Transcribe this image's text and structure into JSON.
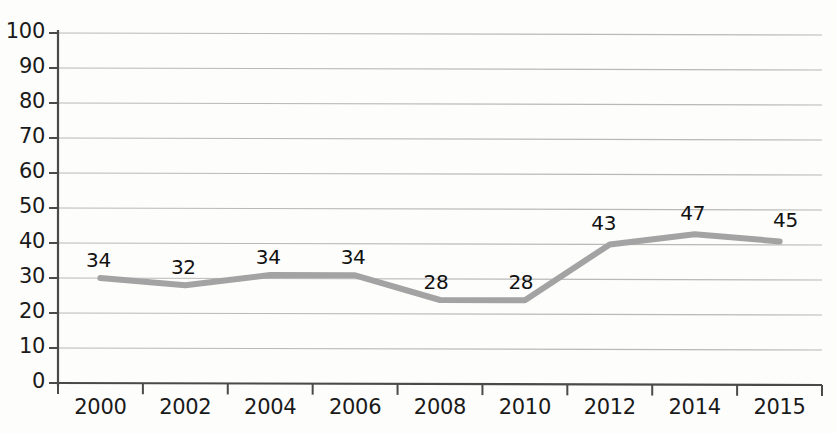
{
  "chart_data": {
    "type": "line",
    "title": "",
    "subtitle": "",
    "xlabel": "",
    "ylabel": "",
    "categories": [
      "2000",
      "2002",
      "2004",
      "2006",
      "2008",
      "2010",
      "2012",
      "2014",
      "2015"
    ],
    "values": [
      34,
      32,
      34,
      34,
      28,
      28,
      43,
      47,
      45
    ],
    "plotted_values": [
      30,
      28,
      31,
      31,
      24,
      24,
      40,
      43,
      41
    ],
    "data_labels": [
      "34",
      "32",
      "34",
      "34",
      "28",
      "28",
      "43",
      "47",
      "45"
    ],
    "ylim": [
      0,
      100
    ],
    "ytick_values": [
      0,
      10,
      20,
      30,
      40,
      50,
      60,
      70,
      80,
      90,
      100
    ],
    "ytick_labels": [
      "0",
      "10",
      "20",
      "30",
      "40",
      "50",
      "60",
      "70",
      "80",
      "90",
      "100"
    ],
    "xtick_labels": [
      "2000",
      "2002",
      "2004",
      "2006",
      "2008",
      "2010",
      "2012",
      "2014",
      "2015"
    ],
    "grid": true,
    "grid_axis": "y",
    "legend": false,
    "legend_position": "none",
    "series": [
      {
        "name": "series-1",
        "color": "#a0a0a0",
        "values": [
          34,
          32,
          34,
          34,
          28,
          28,
          43,
          47,
          45
        ]
      }
    ],
    "colors": {
      "line": "#a3a3a3",
      "grid": "#b9b9b9",
      "axis": "#4a4a4a",
      "text": "#141414",
      "background": "#fdfdfc"
    }
  }
}
